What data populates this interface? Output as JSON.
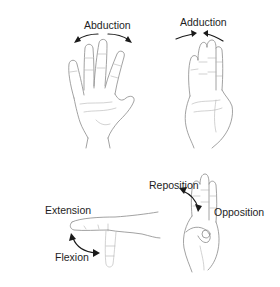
{
  "figure": {
    "panels": [
      {
        "id": "abduction",
        "label": "Abduction",
        "arrow": "diverging-arrows"
      },
      {
        "id": "adduction",
        "label": "Adduction",
        "arrow": "converging-arrows"
      },
      {
        "id": "extension",
        "label": "Extension"
      },
      {
        "id": "flexion",
        "label": "Flexion",
        "arrow": "curved-double-arrow"
      },
      {
        "id": "reposition",
        "label": "Reposition"
      },
      {
        "id": "opposition",
        "label": "Opposition",
        "arrow": "curved-double-arrow"
      }
    ],
    "colors": {
      "line_art": "#8a8a8a",
      "arrows": "#1a1a1a",
      "text": "#1e1e1e",
      "background": "#ffffff"
    }
  }
}
